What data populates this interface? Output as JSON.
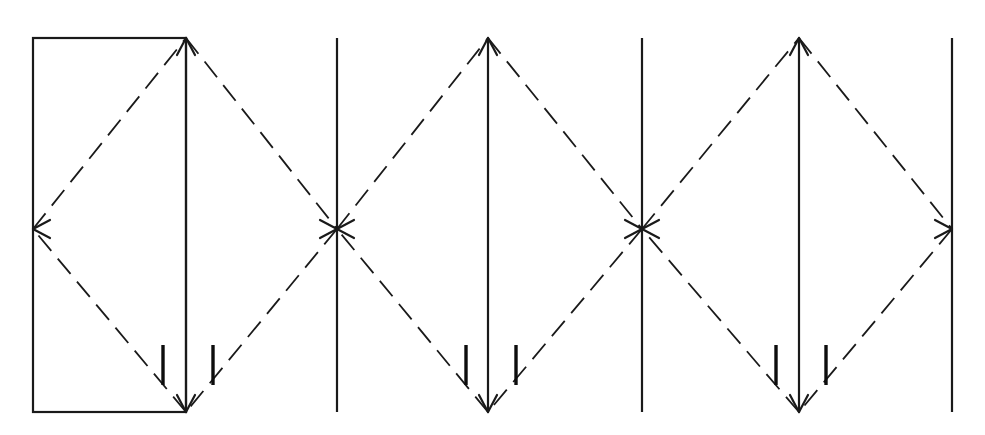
{
  "figure": {
    "canvas_width": 985,
    "canvas_height": 435,
    "background_color": "#ffffff",
    "line_color": "#1a1a1a",
    "tick_color": "#0d0d0d"
  },
  "geometry": {
    "top_y": 38,
    "bottom_y": 412,
    "mid_y": 229,
    "left_x": 33,
    "right_x": 952,
    "dash_pattern": "20 10",
    "solid_width": 2.2,
    "dashed_width": 1.8,
    "tick_width": 3.4,
    "arrowhead_length": 17,
    "arrowhead_half_width": 9
  },
  "boundary_rectangle": {
    "name": "unit-cell-rectangle",
    "x": 33,
    "y": 38,
    "width": 153,
    "height": 374,
    "stroke_width": 2.2
  },
  "vertical_lines": [
    {
      "id": "v1",
      "x": 186,
      "kind": "axis",
      "has_arrowheads": true
    },
    {
      "id": "v2",
      "x": 337,
      "kind": "plain",
      "has_arrowheads": false
    },
    {
      "id": "v3",
      "x": 488,
      "kind": "axis",
      "has_arrowheads": true
    },
    {
      "id": "v4",
      "x": 642,
      "kind": "plain",
      "has_arrowheads": false
    },
    {
      "id": "v5",
      "x": 799,
      "kind": "axis",
      "has_arrowheads": true
    },
    {
      "id": "v6",
      "x": 952,
      "kind": "plain",
      "has_arrowheads": false
    }
  ],
  "diamonds": [
    {
      "id": "d1",
      "center_x": 186,
      "center_y": 229,
      "half_width": 153,
      "top_y": 38,
      "bottom_y": 412,
      "left_apex_x": 33,
      "right_apex_x": 337
    },
    {
      "id": "d2",
      "center_x": 488,
      "center_y": 229,
      "half_width": 152,
      "top_y": 38,
      "bottom_y": 412,
      "left_apex_x": 337,
      "right_apex_x": 642
    },
    {
      "id": "d3",
      "center_x": 799,
      "center_y": 229,
      "half_width": 153,
      "top_y": 38,
      "bottom_y": 412,
      "left_apex_x": 642,
      "right_apex_x": 952
    }
  ],
  "apex_markers": [
    {
      "id": "a-left",
      "x": 33,
      "y": 229,
      "type": "arrowhead-left"
    },
    {
      "id": "a-cross1",
      "x": 337,
      "y": 229,
      "type": "x-crossing"
    },
    {
      "id": "a-cross2",
      "x": 642,
      "y": 229,
      "type": "x-crossing"
    },
    {
      "id": "a-right",
      "x": 952,
      "y": 229,
      "type": "arrowhead-right"
    }
  ],
  "tick_marks": [
    {
      "id": "t1L",
      "x": 163,
      "y_top": 345,
      "y_bottom": 385
    },
    {
      "id": "t1R",
      "x": 213,
      "y_top": 345,
      "y_bottom": 385
    },
    {
      "id": "t2L",
      "x": 466,
      "y_top": 345,
      "y_bottom": 385
    },
    {
      "id": "t2R",
      "x": 516,
      "y_top": 345,
      "y_bottom": 385
    },
    {
      "id": "t3L",
      "x": 776,
      "y_top": 345,
      "y_bottom": 385
    },
    {
      "id": "t3R",
      "x": 826,
      "y_top": 345,
      "y_bottom": 385
    }
  ]
}
